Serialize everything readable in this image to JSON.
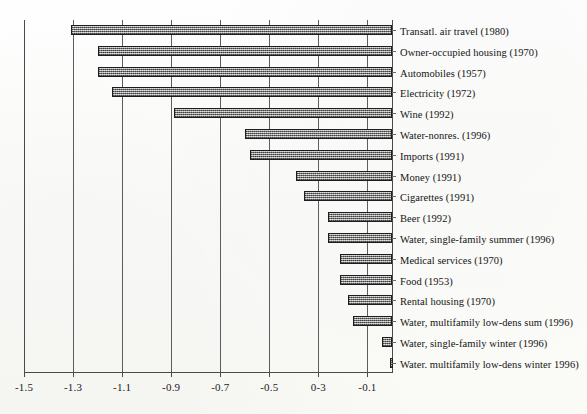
{
  "chart_data": {
    "type": "bar",
    "orientation": "horizontal",
    "title": "",
    "subtitle": "",
    "xlabel": "",
    "ylabel": "",
    "xlim": [
      -1.5,
      0.0
    ],
    "grid": true,
    "legend": null,
    "xticks": [
      -1.5,
      -1.3,
      -1.1,
      -0.9,
      -0.7,
      -0.5,
      -0.3,
      -0.1
    ],
    "xticklabels": [
      "-1.5",
      "-1.3",
      "-1.1",
      "-0.9",
      "-0.7",
      "-0.5",
      "0-3",
      "-0.1"
    ],
    "bar_fill": "#9a9a9a",
    "bar_edge": "#1d1d1d",
    "axis_color": "#4a4a4a",
    "categories": [
      "Transatl. air travel (1980)",
      "Owner-occupied housing (1970)",
      "Automobiles (1957)",
      "Electricity (1972)",
      "Wine (1992)",
      "Water-nonres. (1996)",
      "Imports (1991)",
      "Money (1991)",
      "Cigarettes (1991)",
      "Beer (1992)",
      "Water, single-family summer (1996)",
      "Medical services (1970)",
      "Food (1953)",
      "Rental housing (1970)",
      "Water, multifamily low-dens sum (1996)",
      "Water, single-family winter (1996)",
      "Water. multifamily low-dens winter 1996)"
    ],
    "values": [
      -1.31,
      -1.2,
      -1.2,
      -1.14,
      -0.89,
      -0.6,
      -0.58,
      -0.39,
      -0.36,
      -0.26,
      -0.26,
      -0.21,
      -0.21,
      -0.18,
      -0.16,
      -0.04,
      -0.01
    ]
  }
}
